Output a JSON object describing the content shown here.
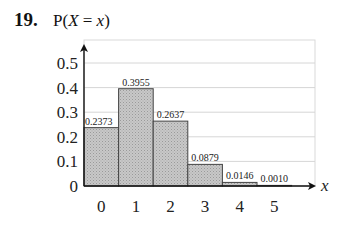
{
  "problem": {
    "number": "19.",
    "title_prefix": "P(",
    "title_var": "X",
    "title_eq": " = ",
    "title_val": "x",
    "title_suffix": ")"
  },
  "colors": {
    "bar_fill": "#c2c2c2",
    "bar_stroke": "#444444",
    "grid": "#d6d6d6",
    "axis": "#111111"
  },
  "chart_data": {
    "type": "bar",
    "title": "P(X = x)",
    "xlabel": "x",
    "ylabel": "P(X = x)",
    "categories": [
      "0",
      "1",
      "2",
      "3",
      "4",
      "5"
    ],
    "values": [
      0.2373,
      0.3955,
      0.2637,
      0.0879,
      0.0146,
      0.001
    ],
    "value_labels": [
      "0.2373",
      "0.3955",
      "0.2637",
      "0.0879",
      "0.0146",
      "0.0010"
    ],
    "y_ticks": [
      "0",
      "0.1",
      "0.2",
      "0.3",
      "0.4",
      "0.5"
    ],
    "ylim": [
      0,
      0.55
    ],
    "grid": true,
    "legend": null
  }
}
